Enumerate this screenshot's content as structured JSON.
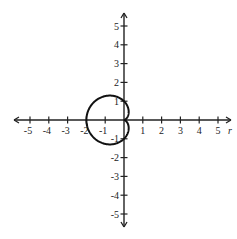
{
  "chart_data": {
    "type": "line",
    "title": "",
    "subtitle": "",
    "equation": "r = 1 - cos(theta)",
    "xlabel": "r",
    "ylabel": "",
    "xlim": [
      -5,
      5
    ],
    "ylim": [
      -5,
      5
    ],
    "grid": false,
    "legend": null,
    "x_ticks": [
      -5,
      -4,
      -3,
      -2,
      -1,
      1,
      2,
      3,
      4,
      5
    ],
    "y_ticks": [
      -5,
      -4,
      -3,
      -2,
      -1,
      1,
      2,
      3,
      4,
      5
    ],
    "series": [
      {
        "name": "cardioid",
        "color": "#111111",
        "key_points": [
          {
            "x": 0,
            "y": 0,
            "note": "cusp at origin"
          },
          {
            "x": -2,
            "y": 0,
            "note": "leftmost point"
          },
          {
            "x": -0.75,
            "y": 1.3,
            "note": "top"
          },
          {
            "x": -0.75,
            "y": -1.3,
            "note": "bottom"
          },
          {
            "x": 0,
            "y": 1,
            "note": "crosses positive y-axis"
          },
          {
            "x": 0,
            "y": -1,
            "note": "crosses negative y-axis"
          }
        ]
      }
    ]
  },
  "axes": {
    "x_axis_label": "r",
    "x_tick_labels": [
      "-5",
      "-4",
      "-3",
      "-2",
      "-1",
      "1",
      "2",
      "3",
      "4",
      "5"
    ],
    "y_tick_labels": [
      "5",
      "4",
      "3",
      "2",
      "1",
      "-1",
      "-2",
      "-3",
      "-4",
      "-5"
    ]
  },
  "colors": {
    "axis": "#222222",
    "curve": "#111111",
    "background": "#ffffff"
  }
}
